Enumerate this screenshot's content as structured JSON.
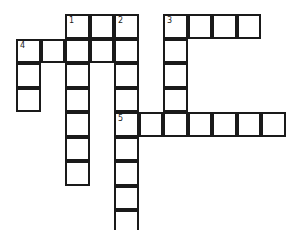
{
  "puzzle": {
    "origin": {
      "x": 17,
      "y": 15
    },
    "cell_size": 24.5,
    "cells": [
      {
        "r": 0,
        "c": 2,
        "n": "1"
      },
      {
        "r": 0,
        "c": 3
      },
      {
        "r": 0,
        "c": 4,
        "n": "2"
      },
      {
        "r": 0,
        "c": 6,
        "n": "3"
      },
      {
        "r": 0,
        "c": 7
      },
      {
        "r": 0,
        "c": 8
      },
      {
        "r": 0,
        "c": 9
      },
      {
        "r": 1,
        "c": 0,
        "n": "4"
      },
      {
        "r": 1,
        "c": 1
      },
      {
        "r": 1,
        "c": 2
      },
      {
        "r": 1,
        "c": 3
      },
      {
        "r": 1,
        "c": 4
      },
      {
        "r": 1,
        "c": 6
      },
      {
        "r": 2,
        "c": 0
      },
      {
        "r": 2,
        "c": 2
      },
      {
        "r": 2,
        "c": 4
      },
      {
        "r": 2,
        "c": 6
      },
      {
        "r": 3,
        "c": 0
      },
      {
        "r": 3,
        "c": 2
      },
      {
        "r": 3,
        "c": 4
      },
      {
        "r": 3,
        "c": 6
      },
      {
        "r": 4,
        "c": 2
      },
      {
        "r": 4,
        "c": 4,
        "n": "5"
      },
      {
        "r": 4,
        "c": 5
      },
      {
        "r": 4,
        "c": 6
      },
      {
        "r": 4,
        "c": 7
      },
      {
        "r": 4,
        "c": 8
      },
      {
        "r": 4,
        "c": 9
      },
      {
        "r": 4,
        "c": 10
      },
      {
        "r": 5,
        "c": 2
      },
      {
        "r": 5,
        "c": 4
      },
      {
        "r": 6,
        "c": 2
      },
      {
        "r": 6,
        "c": 4
      },
      {
        "r": 7,
        "c": 4
      },
      {
        "r": 8,
        "c": 4
      }
    ],
    "entries": {
      "across": [
        {
          "number": "1",
          "row": 0,
          "col": 2,
          "length": 3
        },
        {
          "number": "3",
          "row": 0,
          "col": 6,
          "length": 4
        },
        {
          "number": "4",
          "row": 1,
          "col": 0,
          "length": 5
        },
        {
          "number": "5",
          "row": 4,
          "col": 4,
          "length": 7
        }
      ],
      "down": [
        {
          "number": "1",
          "row": 0,
          "col": 2,
          "length": 7
        },
        {
          "number": "2",
          "row": 0,
          "col": 4,
          "length": 8
        },
        {
          "number": "3",
          "row": 0,
          "col": 6,
          "length": 5
        },
        {
          "number": "4",
          "row": 1,
          "col": 0,
          "length": 3
        }
      ]
    },
    "colors": {
      "border": "#1a1a1a",
      "cell": "#ffffff",
      "number": "#222222"
    }
  }
}
